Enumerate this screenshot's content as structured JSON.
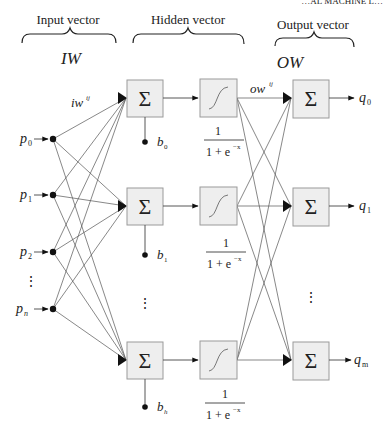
{
  "running_header": "…AL MACHINE L…",
  "sections": {
    "input": {
      "title": "Input vector",
      "weight_label": "IW"
    },
    "hidden": {
      "title": "Hidden vector"
    },
    "output": {
      "title": "Output vector",
      "weight_label": "OW"
    }
  },
  "inputs": [
    {
      "label": "p",
      "sub": "0"
    },
    {
      "label": "p",
      "sub": "1"
    },
    {
      "label": "p",
      "sub": "2"
    },
    {
      "label": "⋮",
      "sub": ""
    },
    {
      "label": "p",
      "sub": "n"
    }
  ],
  "input_weight_label": {
    "base": "iw",
    "sup": "ij"
  },
  "output_weight_label": {
    "base": "ow",
    "sup": "ij"
  },
  "hidden_units": [
    {
      "sum_symbol": "Σ",
      "bias": "b",
      "bias_sub": "0",
      "activation_num": "1",
      "activation_den": "1 + e",
      "activation_exp": "−x"
    },
    {
      "sum_symbol": "Σ",
      "bias": "b",
      "bias_sub": "1",
      "activation_num": "1",
      "activation_den": "1 + e",
      "activation_exp": "−x"
    },
    {
      "sum_symbol": "Σ",
      "bias": "b",
      "bias_sub": "h",
      "activation_num": "1",
      "activation_den": "1 + e",
      "activation_exp": "−x"
    }
  ],
  "hidden_ellipsis": "⋮",
  "outputs": [
    {
      "sum_symbol": "Σ",
      "label": "q",
      "sub": "0"
    },
    {
      "sum_symbol": "Σ",
      "label": "q",
      "sub": "1"
    },
    {
      "sum_symbol": "Σ",
      "label": "q",
      "sub": "m"
    }
  ],
  "output_ellipsis": "⋮",
  "activation_icon": "sigmoid-curve-icon",
  "colors": {
    "box_fill": "#eeeeee",
    "box_stroke": "#9a9a9a",
    "line": "#555555",
    "text": "#222222"
  }
}
